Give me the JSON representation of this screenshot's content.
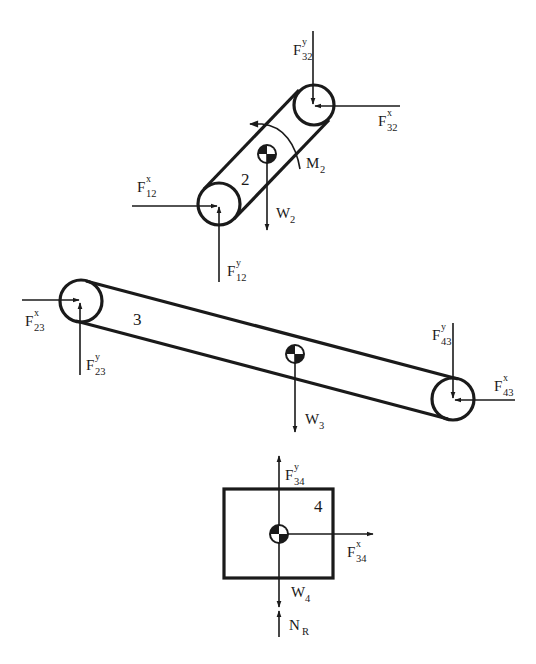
{
  "diagram": {
    "type": "free-body-diagram",
    "colors": {
      "ink": "#1a1a1a",
      "background": "#ffffff"
    },
    "bodies": [
      {
        "id": "link2",
        "label": "2",
        "shape": "link",
        "moment": {
          "base": "M",
          "sub": "2"
        },
        "forces": [
          {
            "id": "F32y",
            "base": "F",
            "sub": "32",
            "sup": "y"
          },
          {
            "id": "F32x",
            "base": "F",
            "sub": "32",
            "sup": "x"
          },
          {
            "id": "F12x",
            "base": "F",
            "sub": "12",
            "sup": "x"
          },
          {
            "id": "F12y",
            "base": "F",
            "sub": "12",
            "sup": "y"
          },
          {
            "id": "W2",
            "base": "W",
            "sub": "2",
            "sup": ""
          }
        ]
      },
      {
        "id": "link3",
        "label": "3",
        "shape": "link",
        "forces": [
          {
            "id": "F23x",
            "base": "F",
            "sub": "23",
            "sup": "x"
          },
          {
            "id": "F23y",
            "base": "F",
            "sub": "23",
            "sup": "y"
          },
          {
            "id": "F43y",
            "base": "F",
            "sub": "43",
            "sup": "y"
          },
          {
            "id": "F43x",
            "base": "F",
            "sub": "43",
            "sup": "x"
          },
          {
            "id": "W3",
            "base": "W",
            "sub": "3",
            "sup": ""
          }
        ]
      },
      {
        "id": "block4",
        "label": "4",
        "shape": "rectangle",
        "forces": [
          {
            "id": "F34y",
            "base": "F",
            "sub": "34",
            "sup": "y"
          },
          {
            "id": "F34x",
            "base": "F",
            "sub": "34",
            "sup": "x"
          },
          {
            "id": "W4",
            "base": "W",
            "sub": "4",
            "sup": ""
          },
          {
            "id": "NR",
            "base": "N",
            "sub": "R",
            "sup": ""
          }
        ]
      }
    ]
  }
}
